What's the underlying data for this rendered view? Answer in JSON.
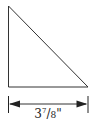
{
  "diagram": {
    "shape": "right-triangle",
    "dimension": {
      "whole": "3",
      "numerator": "7",
      "denominator": "8",
      "unit": "\""
    },
    "stroke_color": "#333333"
  }
}
